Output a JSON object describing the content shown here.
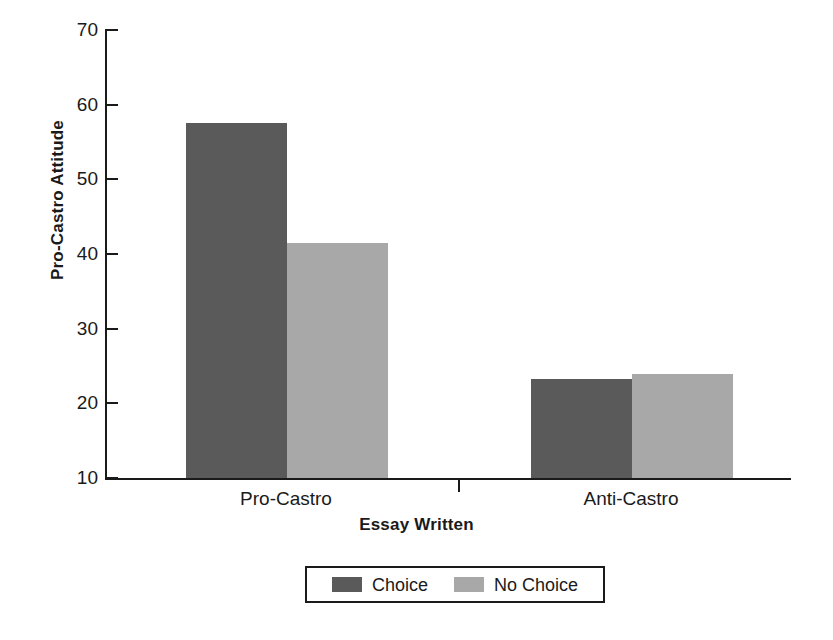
{
  "chart_data": {
    "type": "bar",
    "title": "",
    "xlabel": "Essay Written",
    "ylabel": "Pro-Castro Attitude",
    "categories": [
      "Pro-Castro",
      "Anti-Castro"
    ],
    "series": [
      {
        "name": "Choice",
        "values": [
          57.5,
          23.2
        ],
        "color": "#5a5a5a"
      },
      {
        "name": "No Choice",
        "values": [
          41.5,
          23.9
        ],
        "color": "#a8a8a8"
      }
    ],
    "ylim": [
      10,
      70
    ],
    "yticks": [
      70,
      60,
      50,
      40,
      30,
      20,
      10
    ],
    "ytick_labels": [
      "70",
      "60",
      "50",
      "40",
      "30",
      "20",
      "10"
    ],
    "grid": false,
    "legend_position": "bottom-center",
    "axis_color": "#1a1a1a",
    "background": "#ffffff"
  },
  "legend": {
    "entries": [
      {
        "label": "Choice",
        "color": "#5a5a5a"
      },
      {
        "label": "No Choice",
        "color": "#a8a8a8"
      }
    ]
  }
}
